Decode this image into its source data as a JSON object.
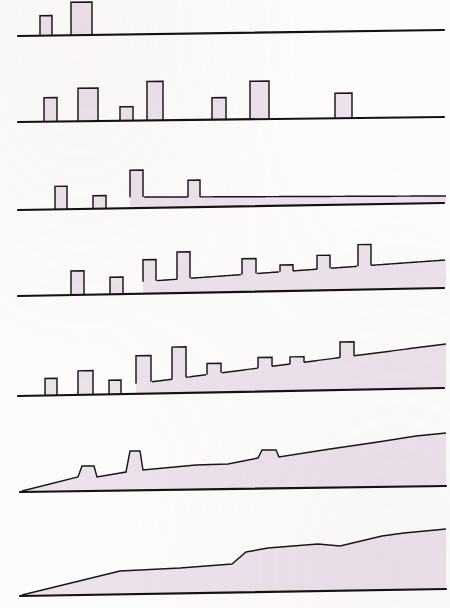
{
  "figure": {
    "width": 450,
    "height": 608,
    "background_color": "#fdfcfc",
    "fill_color": "#ece2ec",
    "outline_color": "#1a1618",
    "axis_color": "#15120f"
  },
  "chart_data": {
    "type": "area",
    "subtitle": "",
    "xlabel": "",
    "ylabel": "",
    "grid": false,
    "legend": "none",
    "axis_ranges": {
      "x": [
        0,
        450
      ],
      "y": [
        0,
        1
      ]
    },
    "panel_count": 7,
    "panels": [
      {
        "index": 1,
        "name": "panel-1-sparse-spikes",
        "top": 0,
        "height": 60,
        "baseline_left_y": 36,
        "baseline_right_y": 30,
        "axis_x_start": 18,
        "axis_x_end": 444,
        "has_filled_band": false,
        "band_points": [],
        "bars": [
          {
            "x": 40,
            "width": 12,
            "height": 20
          },
          {
            "x": 71,
            "width": 21,
            "height": 33
          }
        ]
      },
      {
        "index": 2,
        "name": "panel-2-seven-spikes",
        "top": 70,
        "height": 58,
        "baseline_left_y": 52,
        "baseline_right_y": 47,
        "axis_x_start": 18,
        "axis_x_end": 444,
        "has_filled_band": false,
        "band_points": [],
        "bars": [
          {
            "x": 44,
            "width": 13,
            "height": 24
          },
          {
            "x": 78,
            "width": 20,
            "height": 33
          },
          {
            "x": 120,
            "width": 13,
            "height": 14
          },
          {
            "x": 147,
            "width": 16,
            "height": 39
          },
          {
            "x": 212,
            "width": 14,
            "height": 22
          },
          {
            "x": 250,
            "width": 19,
            "height": 38
          },
          {
            "x": 335,
            "width": 17,
            "height": 25
          }
        ]
      },
      {
        "index": 3,
        "name": "panel-3-spikes-with-thin-band",
        "top": 160,
        "height": 58,
        "baseline_left_y": 50,
        "baseline_right_y": 43,
        "axis_x_start": 18,
        "axis_x_end": 444,
        "has_filled_band": true,
        "band_start_x": 130,
        "band_end_x": 446,
        "band_left_thickness": 11,
        "band_right_thickness": 7,
        "bars": [
          {
            "x": 55,
            "width": 12,
            "height": 23
          },
          {
            "x": 93,
            "width": 13,
            "height": 13
          },
          {
            "x": 130,
            "width": 13,
            "height": 38
          },
          {
            "x": 188,
            "width": 12,
            "height": 27
          }
        ]
      },
      {
        "index": 4,
        "name": "panel-4-dense-bars-rising-band",
        "top": 240,
        "height": 62,
        "baseline_left_y": 56,
        "baseline_right_y": 48,
        "axis_x_start": 18,
        "axis_x_end": 444,
        "has_filled_band": true,
        "band_start_x": 143,
        "band_end_x": 446,
        "band_left_thickness": 12,
        "band_right_thickness": 28,
        "bars": [
          {
            "x": 71,
            "width": 13,
            "height": 24
          },
          {
            "x": 110,
            "width": 13,
            "height": 17
          },
          {
            "x": 143,
            "width": 13,
            "height": 34
          },
          {
            "x": 177,
            "width": 13,
            "height": 41
          },
          {
            "x": 242,
            "width": 14,
            "height": 33
          },
          {
            "x": 280,
            "width": 13,
            "height": 26
          },
          {
            "x": 317,
            "width": 13,
            "height": 35
          },
          {
            "x": 358,
            "width": 13,
            "height": 45
          }
        ]
      },
      {
        "index": 5,
        "name": "panel-5-bars-on-rising-wedge",
        "top": 330,
        "height": 72,
        "baseline_left_y": 66,
        "baseline_right_y": 58,
        "axis_x_start": 18,
        "axis_x_end": 444,
        "has_filled_band": true,
        "band_start_x": 136,
        "band_end_x": 446,
        "band_left_thickness": 10,
        "band_right_thickness": 44,
        "bars": [
          {
            "x": 45,
            "width": 12,
            "height": 17
          },
          {
            "x": 78,
            "width": 15,
            "height": 24
          },
          {
            "x": 109,
            "width": 12,
            "height": 14
          },
          {
            "x": 136,
            "width": 15,
            "height": 38
          },
          {
            "x": 172,
            "width": 14,
            "height": 46
          },
          {
            "x": 207,
            "width": 14,
            "height": 29
          },
          {
            "x": 258,
            "width": 14,
            "height": 34
          },
          {
            "x": 290,
            "width": 14,
            "height": 34
          },
          {
            "x": 340,
            "width": 14,
            "height": 48
          }
        ]
      },
      {
        "index": 6,
        "name": "panel-6-wedge-with-two-spikes",
        "top": 420,
        "height": 80,
        "baseline_left_y": 72,
        "baseline_right_y": 66,
        "axis_x_start": 20,
        "axis_x_end": 446,
        "has_filled_band": true,
        "band_start_x": 22,
        "band_end_x": 446,
        "profile": [
          {
            "x": 22,
            "y": 71
          },
          {
            "x": 78,
            "y": 57
          },
          {
            "x": 82,
            "y": 46
          },
          {
            "x": 94,
            "y": 46
          },
          {
            "x": 97,
            "y": 57
          },
          {
            "x": 126,
            "y": 52
          },
          {
            "x": 130,
            "y": 31
          },
          {
            "x": 140,
            "y": 31
          },
          {
            "x": 143,
            "y": 50
          },
          {
            "x": 196,
            "y": 45
          },
          {
            "x": 228,
            "y": 44
          },
          {
            "x": 258,
            "y": 38
          },
          {
            "x": 262,
            "y": 30
          },
          {
            "x": 276,
            "y": 30
          },
          {
            "x": 279,
            "y": 37
          },
          {
            "x": 330,
            "y": 29
          },
          {
            "x": 378,
            "y": 22
          },
          {
            "x": 416,
            "y": 16
          },
          {
            "x": 446,
            "y": 13
          }
        ],
        "bars": []
      },
      {
        "index": 7,
        "name": "panel-7-smooth-filled-wedge",
        "top": 510,
        "height": 98,
        "baseline_left_y": 86,
        "baseline_right_y": 79,
        "axis_x_start": 20,
        "axis_x_end": 446,
        "has_filled_band": true,
        "band_start_x": 22,
        "band_end_x": 446,
        "profile": [
          {
            "x": 22,
            "y": 85
          },
          {
            "x": 120,
            "y": 61
          },
          {
            "x": 180,
            "y": 58
          },
          {
            "x": 232,
            "y": 54
          },
          {
            "x": 246,
            "y": 42
          },
          {
            "x": 268,
            "y": 38
          },
          {
            "x": 318,
            "y": 34
          },
          {
            "x": 340,
            "y": 36
          },
          {
            "x": 382,
            "y": 26
          },
          {
            "x": 404,
            "y": 23
          },
          {
            "x": 446,
            "y": 19
          }
        ],
        "bars": []
      }
    ]
  }
}
